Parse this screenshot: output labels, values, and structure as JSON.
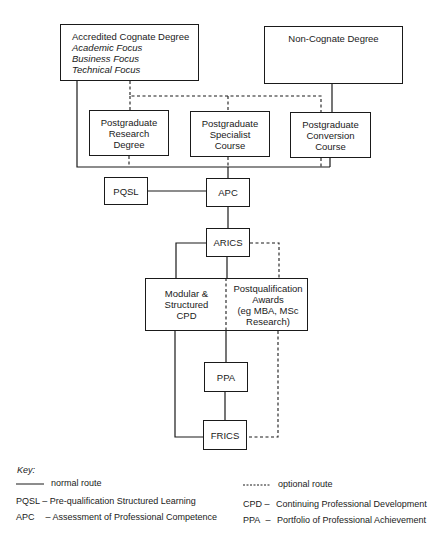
{
  "diagram": {
    "nodes": {
      "cognate": {
        "title": "Accredited Cognate Degree",
        "sub": [
          "Academic Focus",
          "Business Focus",
          "Technical Focus"
        ]
      },
      "non_cognate": {
        "title": "Non-Cognate Degree"
      },
      "pg_research": {
        "lines": [
          "Postgraduate",
          "Research",
          "Degree"
        ]
      },
      "pg_specialist": {
        "lines": [
          "Postgraduate",
          "Specialist",
          "Course"
        ]
      },
      "pg_conversion": {
        "lines": [
          "Postgraduate",
          "Conversion",
          "Course"
        ]
      },
      "pqsl": {
        "label": "PQSL"
      },
      "apc": {
        "label": "APC"
      },
      "arics": {
        "label": "ARICS"
      },
      "cpd": {
        "lines": [
          "Modular &",
          "Structured",
          "CPD"
        ]
      },
      "pq_awards": {
        "lines": [
          "Postqualification",
          "Awards",
          "(eg MBA, MSc",
          "Research)"
        ]
      },
      "ppa": {
        "label": "PPA"
      },
      "frics": {
        "label": "FRICS"
      }
    },
    "edges": [
      {
        "from": "cognate",
        "to": "apc",
        "style": "normal"
      },
      {
        "from": "cognate",
        "to": "pg_research",
        "style": "optional"
      },
      {
        "from": "cognate",
        "to": "pg_specialist",
        "style": "optional"
      },
      {
        "from": "cognate",
        "to": "pg_conversion",
        "style": "optional"
      },
      {
        "from": "non_cognate",
        "to": "pg_conversion",
        "style": "normal"
      },
      {
        "from": "pg_research",
        "to": "apc",
        "style": "optional"
      },
      {
        "from": "pg_specialist",
        "to": "apc",
        "style": "optional"
      },
      {
        "from": "pg_conversion",
        "to": "apc",
        "style": "optional"
      },
      {
        "from": "pg_conversion",
        "to": "apc",
        "style": "normal"
      },
      {
        "from": "pqsl",
        "to": "apc",
        "style": "normal"
      },
      {
        "from": "apc",
        "to": "arics",
        "style": "normal"
      },
      {
        "from": "arics",
        "to": "cpd",
        "style": "normal"
      },
      {
        "from": "arics",
        "to": "pq_awards",
        "style": "optional"
      },
      {
        "from": "cpd",
        "to": "ppa",
        "style": "normal"
      },
      {
        "from": "cpd",
        "to": "frics",
        "style": "normal"
      },
      {
        "from": "ppa",
        "to": "frics",
        "style": "normal"
      },
      {
        "from": "pq_awards",
        "to": "frics",
        "style": "optional"
      }
    ]
  },
  "key": {
    "title": "Key:",
    "normal_route": "normal route",
    "optional_route": "optional route",
    "abbreviations": [
      {
        "abbr": "PQSL",
        "dash": "–",
        "meaning": "Pre-qualification Structured Learning"
      },
      {
        "abbr": "APC",
        "dash": "–",
        "meaning": "Assessment of Professional Competence"
      },
      {
        "abbr": "CPD",
        "dash": "–",
        "meaning": "Continuing Professional Development"
      },
      {
        "abbr": "PPA",
        "dash": "–",
        "meaning": "Portfolio of Professional Achievement"
      }
    ]
  },
  "colors": {
    "line": "#1a1a1a",
    "background": "#ffffff"
  }
}
